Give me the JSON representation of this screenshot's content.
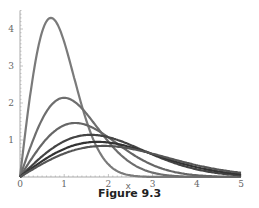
{
  "figure": {
    "caption": "Figure 9.3"
  },
  "chart_data": {
    "type": "line",
    "title": "",
    "xlabel": "x",
    "ylabel": "",
    "xlim": [
      0,
      5
    ],
    "ylim": [
      0,
      4.5
    ],
    "grid": false,
    "legend": null,
    "x_ticks": [
      "0",
      "1",
      "2",
      "3",
      "4",
      "5"
    ],
    "y_ticks": [
      "1",
      "2",
      "3",
      "4"
    ],
    "x": [
      0,
      0.5,
      1,
      1.5,
      2,
      2.5,
      3,
      3.5,
      4,
      4.5,
      5
    ],
    "series": [
      {
        "name": "curve-1",
        "peak_x": 0.7,
        "peak_y": 4.3,
        "color": "#7a7a7a",
        "values": [
          0,
          3.92,
          3.65,
          1.53,
          0.34,
          0.04,
          0,
          0,
          0,
          0,
          0
        ]
      },
      {
        "name": "curve-2",
        "peak_x": 1.0,
        "peak_y": 2.14,
        "color": "#6e6e6e",
        "values": [
          0,
          1.39,
          2.14,
          1.68,
          0.95,
          0.35,
          0.1,
          0.02,
          0,
          0,
          0
        ]
      },
      {
        "name": "curve-3",
        "peak_x": 1.25,
        "peak_y": 1.46,
        "color": "#666666",
        "values": [
          0,
          0.77,
          1.41,
          1.38,
          1.03,
          0.6,
          0.28,
          0.1,
          0.03,
          0.01,
          0
        ]
      },
      {
        "name": "curve-4",
        "peak_x": 1.6,
        "peak_y": 1.14,
        "color": "#444444",
        "values": [
          0,
          0.5,
          0.88,
          1.13,
          1.09,
          0.87,
          0.58,
          0.32,
          0.15,
          0.06,
          0.02
        ]
      },
      {
        "name": "curve-5",
        "peak_x": 1.75,
        "peak_y": 0.95,
        "color": "#333333",
        "values": [
          0,
          0.4,
          0.73,
          0.91,
          0.93,
          0.8,
          0.6,
          0.39,
          0.22,
          0.11,
          0.05
        ]
      },
      {
        "name": "curve-6",
        "peak_x": 1.9,
        "peak_y": 0.84,
        "color": "#555555",
        "values": [
          0,
          0.34,
          0.62,
          0.79,
          0.83,
          0.76,
          0.61,
          0.44,
          0.29,
          0.17,
          0.09
        ]
      }
    ]
  }
}
